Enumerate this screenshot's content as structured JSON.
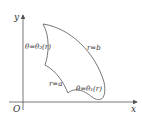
{
  "diagram": {
    "axes": {
      "x_label": "x",
      "y_label": "y",
      "origin_label": "O"
    },
    "boundaries": {
      "outer_arc": "r=b",
      "inner_arc": "r=a",
      "lower_curve": "θ=θ₁(r)",
      "upper_curve": "θ=θ₂(r)"
    },
    "colors": {
      "stroke": "#555555",
      "text": "#333333"
    }
  }
}
